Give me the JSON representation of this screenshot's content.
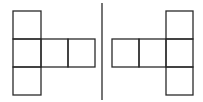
{
  "diagram": {
    "stroke_color": "#2a2a2a",
    "background": "#ffffff",
    "left_net": {
      "squares": [
        {
          "x": 13,
          "y": 11,
          "w": 28,
          "h": 28
        },
        {
          "x": 13,
          "y": 39,
          "w": 28,
          "h": 28
        },
        {
          "x": 13,
          "y": 67,
          "w": 28,
          "h": 28
        },
        {
          "x": 41,
          "y": 39,
          "w": 27,
          "h": 28
        },
        {
          "x": 68,
          "y": 39,
          "w": 27,
          "h": 28
        }
      ]
    },
    "divider": {
      "x": 102,
      "y1": 3,
      "y2": 100
    },
    "right_net": {
      "squares": [
        {
          "x": 166,
          "y": 11,
          "w": 27,
          "h": 28
        },
        {
          "x": 166,
          "y": 39,
          "w": 27,
          "h": 28
        },
        {
          "x": 166,
          "y": 67,
          "w": 27,
          "h": 28
        },
        {
          "x": 112,
          "y": 39,
          "w": 27,
          "h": 28
        },
        {
          "x": 139,
          "y": 39,
          "w": 27,
          "h": 28
        }
      ]
    }
  }
}
